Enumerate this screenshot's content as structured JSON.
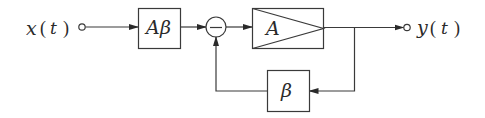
{
  "diagram": {
    "type": "block-diagram",
    "colors": {
      "stroke": "#3a3a3a",
      "background": "#ffffff",
      "text": "#2a2a2a"
    },
    "input": {
      "label_var": "x",
      "label_arg": "t",
      "label": "x(t)"
    },
    "output": {
      "label_var": "y",
      "label_arg": "t",
      "label": "y(t)"
    },
    "blocks": [
      {
        "id": "prescale",
        "label": "Aβ",
        "shape": "rectangle"
      },
      {
        "id": "amplifier",
        "label": "A",
        "shape": "rectangle-with-triangle"
      },
      {
        "id": "feedback",
        "label": "β",
        "shape": "rectangle"
      }
    ],
    "summing_junction": {
      "sign": "−",
      "inputs": [
        "prescale",
        "feedback"
      ]
    },
    "connections": [
      {
        "from": "input",
        "to": "prescale"
      },
      {
        "from": "prescale",
        "to": "summing_junction"
      },
      {
        "from": "summing_junction",
        "to": "amplifier"
      },
      {
        "from": "amplifier",
        "to": "output"
      },
      {
        "from": "amplifier",
        "to": "feedback"
      },
      {
        "from": "feedback",
        "to": "summing_junction"
      }
    ],
    "text": {
      "x": "x",
      "y": "y",
      "t": "t",
      "lparen": "(",
      "rparen": ")",
      "A_beta_A": "A",
      "A_beta_beta": "β",
      "A": "A",
      "beta": "β",
      "minus": "−"
    }
  }
}
